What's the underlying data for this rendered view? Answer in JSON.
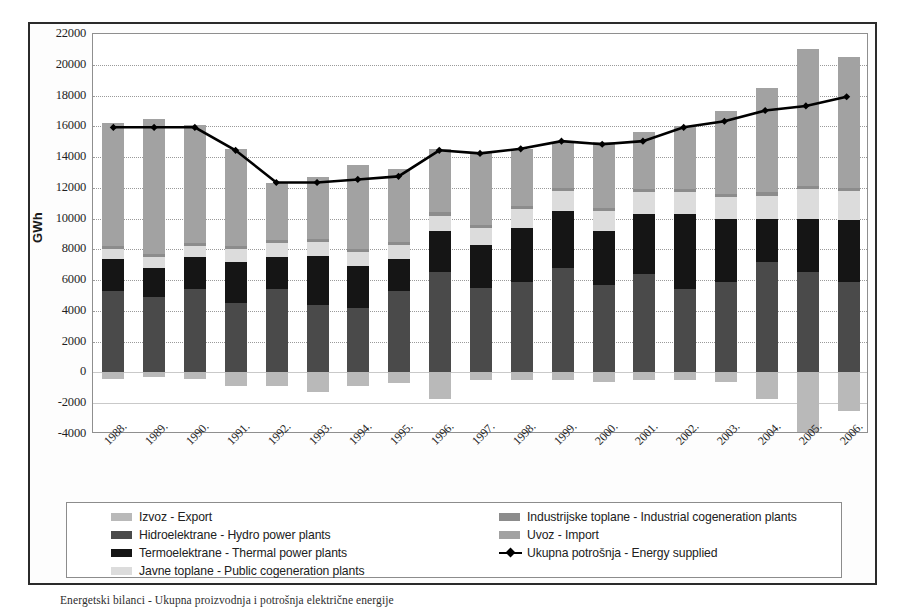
{
  "figure": {
    "caption": "Energetski bilanci - Ukupna proizvodnja i potrošnja električne energije"
  },
  "axes": {
    "y_title": "GWh",
    "y_ticks": [
      22000,
      20000,
      18000,
      16000,
      14000,
      12000,
      10000,
      8000,
      6000,
      4000,
      2000,
      0,
      -2000,
      -4000
    ],
    "y_min": -4000,
    "y_max": 22000,
    "x_ticks": [
      "1988.",
      "1989.",
      "1990.",
      "1991.",
      "1992.",
      "1993.",
      "1994.",
      "1995.",
      "1996.",
      "1997.",
      "1998.",
      "1999.",
      "2000.",
      "2001.",
      "2002.",
      "2003.",
      "2004.",
      "2005.",
      "2006."
    ]
  },
  "legend": {
    "left_column": [
      {
        "label": "Izvoz - Export",
        "color": "#b9b9b9",
        "kind": "swatch"
      },
      {
        "label": "Hidroelektrane - Hydro power plants",
        "color": "#4a4a4a",
        "kind": "swatch"
      },
      {
        "label": "Termoelektrane  - Thermal power plants",
        "color": "#151515",
        "kind": "swatch"
      },
      {
        "label": "Javne toplane - Public cogeneration plants",
        "color": "#dcdcdc",
        "kind": "swatch"
      }
    ],
    "right_column": [
      {
        "label": "Industrijske toplane - Industrial cogeneration plants",
        "color": "#8c8c8c",
        "kind": "swatch"
      },
      {
        "label": "Uvoz - Import",
        "color": "#a2a2a2",
        "kind": "swatch"
      },
      {
        "label": "Ukupna potrošnja - Energy supplied",
        "color": "#000000",
        "kind": "line"
      }
    ]
  },
  "chart_data": {
    "type": "bar",
    "subtype": "stacked-bar-with-line-overlay",
    "title": "",
    "xlabel": "",
    "ylabel": "GWh",
    "ylim": [
      -4000,
      22000
    ],
    "ytick_step": 2000,
    "grid": true,
    "legend_position": "bottom",
    "categories": [
      "1988.",
      "1989.",
      "1990.",
      "1991.",
      "1992.",
      "1993.",
      "1994.",
      "1995.",
      "1996.",
      "1997.",
      "1998.",
      "1999.",
      "2000.",
      "2001.",
      "2002.",
      "2003.",
      "2004.",
      "2005.",
      "2006."
    ],
    "series": [
      {
        "name": "Hidroelektrane - Hydro power plants",
        "color": "#4a4a4a",
        "stack": "positive",
        "values": [
          5300,
          4900,
          5400,
          4500,
          5400,
          4400,
          4200,
          5300,
          6500,
          5500,
          5900,
          6800,
          5700,
          6400,
          5400,
          5900,
          7200,
          6500,
          5900
        ]
      },
      {
        "name": "Termoelektrane  - Thermal power plants",
        "color": "#151515",
        "stack": "positive",
        "values": [
          2100,
          1900,
          2100,
          2700,
          2100,
          3200,
          2700,
          2100,
          2700,
          2800,
          3500,
          3700,
          3500,
          3900,
          4900,
          4100,
          2800,
          3500,
          4000
        ]
      },
      {
        "name": "Javne toplane - Public cogeneration plants",
        "color": "#dcdcdc",
        "stack": "positive",
        "values": [
          600,
          700,
          700,
          800,
          900,
          900,
          900,
          900,
          1000,
          1100,
          1200,
          1300,
          1300,
          1400,
          1400,
          1400,
          1500,
          1900,
          1900
        ]
      },
      {
        "name": "Industrijske toplane - Industrial cogeneration plants",
        "color": "#8c8c8c",
        "stack": "positive",
        "values": [
          200,
          200,
          200,
          200,
          200,
          200,
          200,
          200,
          200,
          200,
          200,
          200,
          200,
          200,
          200,
          200,
          200,
          200,
          200
        ]
      },
      {
        "name": "Uvoz - Import",
        "color": "#a2a2a2",
        "stack": "positive",
        "values": [
          8000,
          8800,
          7700,
          6300,
          3700,
          4000,
          5500,
          4700,
          4100,
          4700,
          3700,
          3000,
          4300,
          3700,
          4100,
          5400,
          6800,
          8900,
          8500
        ]
      },
      {
        "name": "Izvoz - Export",
        "color": "#b9b9b9",
        "stack": "negative",
        "values": [
          -400,
          -300,
          -400,
          -900,
          -900,
          -1300,
          -900,
          -700,
          -1700,
          -500,
          -500,
          -500,
          -600,
          -500,
          -500,
          -600,
          -1700,
          -3900,
          -2500
        ]
      }
    ],
    "line_series": {
      "name": "Ukupna potrošnja - Energy supplied",
      "color": "#000000",
      "marker": "diamond",
      "values": [
        15900,
        15900,
        15900,
        14400,
        12300,
        12300,
        12500,
        12700,
        14400,
        14200,
        14500,
        15000,
        14800,
        15000,
        15900,
        16300,
        17000,
        17300,
        17900
      ]
    }
  }
}
